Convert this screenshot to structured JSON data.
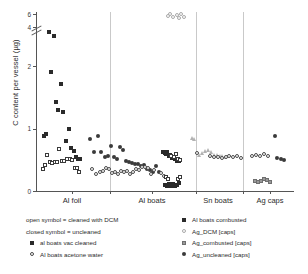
{
  "chart_data": {
    "type": "scatter",
    "title": "",
    "xlabel": "",
    "ylabel": "C content per vessel (µg)",
    "ylim": [
      0,
      6
    ],
    "ytick_labels": [
      "0",
      "1",
      "2",
      "4",
      "6"
    ],
    "ytick_values": [
      0,
      1,
      2,
      4,
      6
    ],
    "axis_break_between": [
      2,
      4
    ],
    "grid": false,
    "legend_position": "below-plot",
    "categories": [
      "Al foil",
      "Al boats",
      "Sn boats",
      "Ag caps"
    ],
    "legend_notes": [
      "open symbol = cleaned with DCM",
      "closed symbol = uncleaned"
    ],
    "series": [
      {
        "name": "al boats vac cleaned",
        "marker": "sq-filled",
        "points": [
          {
            "x": 8,
            "y": 0.88
          },
          {
            "x": 10,
            "y": 0.9
          },
          {
            "x": 13,
            "y": 3.12
          },
          {
            "x": 15,
            "y": 1.9
          },
          {
            "x": 18,
            "y": 2.6
          },
          {
            "x": 20,
            "y": 1.42
          },
          {
            "x": 22,
            "y": 1.29
          },
          {
            "x": 25,
            "y": 1.71
          },
          {
            "x": 27,
            "y": 1.25
          },
          {
            "x": 30,
            "y": 0.79
          },
          {
            "x": 33,
            "y": 0.99
          },
          {
            "x": 35,
            "y": 0.68
          },
          {
            "x": 38,
            "y": 0.64
          },
          {
            "x": 40,
            "y": 0.54
          },
          {
            "x": 42,
            "y": 0.5
          },
          {
            "x": 44,
            "y": 0.51
          }
        ]
      },
      {
        "name": "Al boats acetone water",
        "marker": "sq-open",
        "points": [
          {
            "x": 7,
            "y": 0.34
          },
          {
            "x": 9,
            "y": 0.41
          },
          {
            "x": 11,
            "y": 0.57
          },
          {
            "x": 14,
            "y": 0.46
          },
          {
            "x": 16,
            "y": 0.44
          },
          {
            "x": 19,
            "y": 0.45
          },
          {
            "x": 21,
            "y": 0.45
          },
          {
            "x": 23,
            "y": 0.66
          },
          {
            "x": 26,
            "y": 0.47
          },
          {
            "x": 28,
            "y": 0.48
          },
          {
            "x": 31,
            "y": 0.5
          },
          {
            "x": 34,
            "y": 0.5
          },
          {
            "x": 36,
            "y": 0.49
          },
          {
            "x": 39,
            "y": 0.36
          },
          {
            "x": 41,
            "y": 0.36
          },
          {
            "x": 43,
            "y": 0.3
          }
        ]
      },
      {
        "name": "Al boats combusted",
        "marker": "ci-filled",
        "points": [
          {
            "x": 54,
            "y": 0.83
          },
          {
            "x": 58,
            "y": 0.62
          },
          {
            "x": 62,
            "y": 0.88
          },
          {
            "x": 66,
            "y": 0.62
          },
          {
            "x": 70,
            "y": 0.54
          },
          {
            "x": 73,
            "y": 0.55
          },
          {
            "x": 76,
            "y": 0.71
          },
          {
            "x": 79,
            "y": 0.53
          },
          {
            "x": 82,
            "y": 0.5
          },
          {
            "x": 85,
            "y": 0.7
          },
          {
            "x": 88,
            "y": 0.65
          },
          {
            "x": 91,
            "y": 0.48
          },
          {
            "x": 94,
            "y": 0.46
          },
          {
            "x": 97,
            "y": 0.44
          },
          {
            "x": 100,
            "y": 0.43
          },
          {
            "x": 103,
            "y": 0.42
          },
          {
            "x": 106,
            "y": 0.4
          },
          {
            "x": 109,
            "y": 0.41
          },
          {
            "x": 112,
            "y": 0.35
          },
          {
            "x": 115,
            "y": 0.33
          },
          {
            "x": 118,
            "y": 0.3
          },
          {
            "x": 121,
            "y": 0.4
          },
          {
            "x": 124,
            "y": 0.29
          }
        ]
      },
      {
        "name": "Al boats acetone water (open circles)",
        "marker": "ci-open",
        "points": [
          {
            "x": 56,
            "y": 0.34
          },
          {
            "x": 60,
            "y": 0.26
          },
          {
            "x": 64,
            "y": 0.3
          },
          {
            "x": 68,
            "y": 0.31
          },
          {
            "x": 71,
            "y": 0.36
          },
          {
            "x": 74,
            "y": 0.35
          },
          {
            "x": 77,
            "y": 0.28
          },
          {
            "x": 80,
            "y": 0.29
          },
          {
            "x": 83,
            "y": 0.27
          },
          {
            "x": 86,
            "y": 0.31
          },
          {
            "x": 89,
            "y": 0.3
          },
          {
            "x": 92,
            "y": 0.32
          },
          {
            "x": 95,
            "y": 0.26
          },
          {
            "x": 98,
            "y": 0.3
          },
          {
            "x": 101,
            "y": 0.35
          },
          {
            "x": 104,
            "y": 0.33
          },
          {
            "x": 107,
            "y": 0.38
          },
          {
            "x": 110,
            "y": 0.38
          },
          {
            "x": 113,
            "y": 0.36
          },
          {
            "x": 116,
            "y": 0.27
          },
          {
            "x": 119,
            "y": 0.33
          },
          {
            "x": 126,
            "y": 0.28
          },
          {
            "x": 129,
            "y": 0.23
          }
        ]
      },
      {
        "name": "Al boats cluster uncleaned",
        "marker": "sq-filled",
        "points": [
          {
            "x": 128,
            "y": 0.62
          },
          {
            "x": 130,
            "y": 0.6
          },
          {
            "x": 132,
            "y": 0.58
          },
          {
            "x": 133,
            "y": 0.61
          },
          {
            "x": 135,
            "y": 0.55
          },
          {
            "x": 136,
            "y": 0.57
          },
          {
            "x": 138,
            "y": 0.52
          },
          {
            "x": 139,
            "y": 0.54
          },
          {
            "x": 141,
            "y": 0.5
          },
          {
            "x": 143,
            "y": 0.48
          },
          {
            "x": 145,
            "y": 0.47
          },
          {
            "x": 131,
            "y": 0.09
          },
          {
            "x": 133,
            "y": 0.07
          },
          {
            "x": 135,
            "y": 0.11
          },
          {
            "x": 137,
            "y": 0.08
          },
          {
            "x": 139,
            "y": 0.1
          },
          {
            "x": 141,
            "y": 0.07
          },
          {
            "x": 143,
            "y": 0.09
          },
          {
            "x": 145,
            "y": 0.12
          }
        ]
      },
      {
        "name": "Al boats cluster cleaned",
        "marker": "sq-open",
        "points": [
          {
            "x": 137,
            "y": 0.56
          },
          {
            "x": 140,
            "y": 0.53
          },
          {
            "x": 142,
            "y": 0.58
          },
          {
            "x": 144,
            "y": 0.51
          },
          {
            "x": 146,
            "y": 0.49
          },
          {
            "x": 132,
            "y": 0.21
          },
          {
            "x": 134,
            "y": 0.19
          },
          {
            "x": 144,
            "y": 0.19
          },
          {
            "x": 146,
            "y": 0.21
          }
        ]
      },
      {
        "name": "Ag_DCM [caps] high",
        "marker": "ci-gray",
        "points": [
          {
            "x": 136,
            "y": 5.95
          },
          {
            "x": 143,
            "y": 5.8
          },
          {
            "x": 147,
            "y": 5.9
          },
          {
            "x": 139,
            "y": 5.45
          },
          {
            "x": 145,
            "y": 5.3
          },
          {
            "x": 150,
            "y": 5.4
          },
          {
            "x": 134,
            "y": 5.55
          }
        ]
      },
      {
        "name": "Ag_combusted [caps]",
        "marker": "tri-gray",
        "points": [
          {
            "x": 158,
            "y": 0.85
          },
          {
            "x": 160,
            "y": 0.83
          },
          {
            "x": 165,
            "y": 0.58
          },
          {
            "x": 168,
            "y": 0.6
          },
          {
            "x": 171,
            "y": 0.64
          },
          {
            "x": 174,
            "y": 0.66
          },
          {
            "x": 177,
            "y": 0.62
          },
          {
            "x": 180,
            "y": 0.58
          },
          {
            "x": 183,
            "y": 0.57
          },
          {
            "x": 186,
            "y": 0.55
          },
          {
            "x": 189,
            "y": 0.56
          },
          {
            "x": 192,
            "y": 0.54
          }
        ]
      },
      {
        "name": "Sn boats open circles",
        "marker": "ci-open",
        "points": [
          {
            "x": 163,
            "y": 0.6
          },
          {
            "x": 176,
            "y": 0.55
          },
          {
            "x": 180,
            "y": 0.53
          },
          {
            "x": 184,
            "y": 0.54
          },
          {
            "x": 188,
            "y": 0.52
          },
          {
            "x": 192,
            "y": 0.53
          },
          {
            "x": 196,
            "y": 0.56
          },
          {
            "x": 200,
            "y": 0.54
          },
          {
            "x": 204,
            "y": 0.55
          },
          {
            "x": 208,
            "y": 0.52
          }
        ]
      },
      {
        "name": "Ag_DCM [caps]",
        "marker": "ci-open",
        "points": [
          {
            "x": 219,
            "y": 0.56
          },
          {
            "x": 223,
            "y": 0.57
          },
          {
            "x": 227,
            "y": 0.55
          },
          {
            "x": 231,
            "y": 0.58
          },
          {
            "x": 235,
            "y": 0.56
          }
        ]
      },
      {
        "name": "Ag_uncleaned [caps]",
        "marker": "ci-filled",
        "points": [
          {
            "x": 242,
            "y": 0.88
          },
          {
            "x": 244,
            "y": 0.52
          },
          {
            "x": 248,
            "y": 0.5
          },
          {
            "x": 251,
            "y": 0.49
          }
        ]
      },
      {
        "name": "Ag caps gray squares",
        "marker": "sq-gray",
        "points": [
          {
            "x": 222,
            "y": 0.15
          },
          {
            "x": 225,
            "y": 0.13
          },
          {
            "x": 228,
            "y": 0.16
          },
          {
            "x": 231,
            "y": 0.19
          },
          {
            "x": 234,
            "y": 0.17
          },
          {
            "x": 237,
            "y": 0.14
          }
        ]
      }
    ]
  },
  "axis": {
    "y_title": "C content per vessel (µg)",
    "ticks": [
      {
        "label": "6",
        "value": 6
      },
      {
        "label": "4",
        "value": 4
      },
      {
        "label": "2",
        "value": 2
      },
      {
        "label": "1",
        "value": 1
      },
      {
        "label": "0",
        "value": 0
      }
    ]
  },
  "categories": [
    {
      "label": "Al foil"
    },
    {
      "label": "Al boats"
    },
    {
      "label": "Sn boats"
    },
    {
      "label": "Ag caps"
    }
  ],
  "legend": {
    "notes": [
      "open symbol = cleaned with DCM",
      "closed symbol = uncleaned"
    ],
    "left_items": [
      {
        "label": "al boats vac cleaned",
        "marker": "sq-filled"
      },
      {
        "label": "Al boats acetone water",
        "marker": "ci-open"
      }
    ],
    "right_items": [
      {
        "label": "Al boats combusted",
        "marker": "sq-filled"
      },
      {
        "label": "Ag_DCM [caps]",
        "marker": "ci-gray"
      },
      {
        "label": "Ag_combusted [caps]",
        "marker": "sq-gray"
      },
      {
        "label": "Ag_uncleaned [caps]",
        "marker": "ci-filled"
      }
    ]
  },
  "colors": {
    "axis": "#555555",
    "marker_dark": "#2a2a2a",
    "marker_gray": "#9a9a9a",
    "separator": "#c9c9c9"
  }
}
